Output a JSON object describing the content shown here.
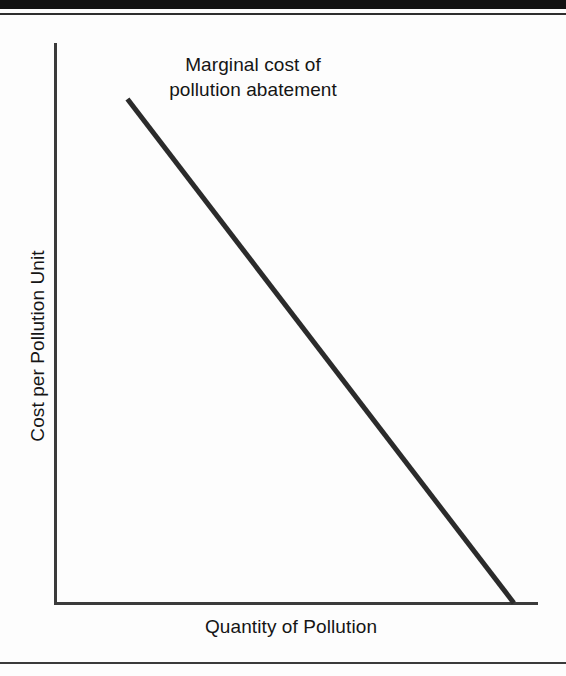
{
  "page": {
    "background_color": "#fdfdfd",
    "ink_color": "#151515"
  },
  "decor": {
    "top_bar_color": "#121212",
    "rule_color": "#3a3a3a"
  },
  "chart_data": {
    "type": "line",
    "title": "",
    "annotation": {
      "line1": "Marginal cost of",
      "line2": "pollution abatement"
    },
    "xlabel": "Quantity of Pollution",
    "ylabel": "Cost per Pollution Unit",
    "xlim": [
      0,
      100
    ],
    "ylim": [
      0,
      100
    ],
    "grid": false,
    "legend": null,
    "axis_ticks": {
      "x": [],
      "y": []
    },
    "series": [
      {
        "name": "Marginal cost of pollution abatement",
        "color": "#2b2b2b",
        "line_width": 5,
        "x": [
          15,
          95
        ],
        "y": [
          90,
          0
        ]
      }
    ]
  }
}
